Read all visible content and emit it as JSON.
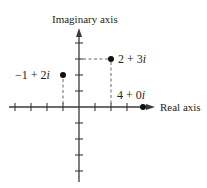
{
  "diagram": {
    "axes": {
      "x_label": "Real axis",
      "y_label": "Imaginary axis",
      "x_ticks": [
        -4,
        -3,
        -2,
        -1,
        1,
        2,
        3
      ],
      "y_ticks": [
        -4,
        -3,
        -2,
        -1,
        1,
        2,
        3,
        4
      ],
      "x_range": [
        -4.4,
        4.6
      ],
      "y_range": [
        -4.6,
        4.9
      ]
    },
    "points": [
      {
        "re": -1,
        "im": 2,
        "label": "−1 + 2i",
        "label_parts": [
          "−1 + 2",
          "i"
        ]
      },
      {
        "re": 2,
        "im": 3,
        "label": "2 + 3i",
        "label_parts": [
          "2 + 3",
          "i"
        ]
      },
      {
        "re": 4,
        "im": 0,
        "label": "4 + 0i",
        "label_parts": [
          "4 + 0",
          "i"
        ]
      }
    ],
    "colors": {
      "axis": "#3a3a3a",
      "point": "#111111",
      "text": "#231f20",
      "background": "#ffffff"
    }
  }
}
